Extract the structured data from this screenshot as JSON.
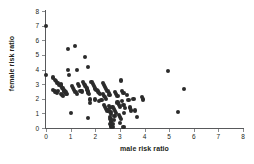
{
  "chart_data": {
    "type": "scatter",
    "title": "",
    "xlabel": "male risk ratio",
    "ylabel": "female risk ratio",
    "xlim": [
      0,
      8
    ],
    "ylim": [
      0,
      8
    ],
    "xticks": [
      0,
      1,
      2,
      3,
      4,
      5,
      6,
      7,
      8
    ],
    "yticks": [
      0,
      1,
      2,
      3,
      4,
      5,
      6,
      7,
      8
    ],
    "xtick_labels": [
      "0",
      "1",
      "2",
      "3",
      "4",
      "5",
      "6",
      "7",
      "8"
    ],
    "ytick_labels": [
      "0",
      "1",
      "2",
      "3",
      "4",
      "5",
      "6",
      "7",
      "8"
    ],
    "grid": false,
    "legend": false,
    "marker": "filled-circle",
    "marker_color": "#2b2b2b",
    "axis_color": "#58595b",
    "background_color": "#ffffff",
    "n_points": 120,
    "points": [
      [
        0.0,
        7.0
      ],
      [
        0.0,
        3.6
      ],
      [
        0.3,
        3.45
      ],
      [
        0.35,
        3.3
      ],
      [
        0.4,
        3.2
      ],
      [
        0.45,
        3.1
      ],
      [
        0.5,
        3.05
      ],
      [
        0.3,
        2.6
      ],
      [
        0.35,
        2.5
      ],
      [
        0.4,
        2.45
      ],
      [
        0.45,
        2.4
      ],
      [
        0.5,
        2.55
      ],
      [
        0.55,
        2.95
      ],
      [
        0.6,
        3.0
      ],
      [
        0.62,
        2.9
      ],
      [
        0.65,
        2.75
      ],
      [
        0.7,
        2.7
      ],
      [
        0.72,
        2.6
      ],
      [
        0.75,
        2.5
      ],
      [
        0.8,
        2.45
      ],
      [
        0.82,
        2.35
      ],
      [
        0.85,
        2.3
      ],
      [
        0.6,
        2.35
      ],
      [
        0.65,
        2.25
      ],
      [
        0.7,
        2.2
      ],
      [
        0.88,
        5.4
      ],
      [
        0.9,
        3.95
      ],
      [
        0.95,
        3.6
      ],
      [
        1.0,
        1.0
      ],
      [
        1.05,
        2.85
      ],
      [
        1.1,
        2.75
      ],
      [
        1.15,
        2.6
      ],
      [
        1.2,
        2.45
      ],
      [
        1.25,
        2.35
      ],
      [
        1.18,
        5.62
      ],
      [
        1.25,
        3.95
      ],
      [
        1.3,
        3.0
      ],
      [
        1.35,
        2.85
      ],
      [
        1.4,
        2.55
      ],
      [
        1.45,
        2.5
      ],
      [
        1.5,
        3.15
      ],
      [
        1.55,
        3.0
      ],
      [
        1.6,
        2.9
      ],
      [
        1.62,
        2.8
      ],
      [
        1.65,
        2.7
      ],
      [
        1.68,
        2.6
      ],
      [
        1.7,
        2.5
      ],
      [
        1.72,
        2.4
      ],
      [
        1.75,
        2.3
      ],
      [
        1.6,
        4.85
      ],
      [
        1.7,
        4.15
      ],
      [
        1.78,
        1.95
      ],
      [
        1.8,
        1.7
      ],
      [
        1.72,
        0.7
      ],
      [
        1.85,
        3.15
      ],
      [
        1.9,
        3.0
      ],
      [
        1.95,
        2.85
      ],
      [
        2.0,
        2.7
      ],
      [
        2.05,
        2.6
      ],
      [
        2.1,
        2.5
      ],
      [
        2.15,
        2.4
      ],
      [
        2.2,
        2.3
      ],
      [
        2.0,
        1.95
      ],
      [
        2.15,
        1.85
      ],
      [
        2.25,
        1.9
      ],
      [
        2.3,
        3.1
      ],
      [
        2.35,
        2.95
      ],
      [
        2.4,
        2.8
      ],
      [
        2.45,
        2.65
      ],
      [
        2.3,
        2.3
      ],
      [
        2.35,
        2.2
      ],
      [
        2.4,
        2.1
      ],
      [
        2.45,
        2.0
      ],
      [
        2.35,
        1.6
      ],
      [
        2.4,
        1.45
      ],
      [
        2.45,
        1.3
      ],
      [
        2.5,
        1.2
      ],
      [
        2.5,
        2.55
      ],
      [
        2.55,
        2.4
      ],
      [
        2.58,
        2.25
      ],
      [
        2.55,
        1.5
      ],
      [
        2.6,
        1.35
      ],
      [
        2.62,
        1.1
      ],
      [
        2.65,
        0.95
      ],
      [
        2.6,
        0.75
      ],
      [
        2.62,
        0.6
      ],
      [
        2.65,
        0.45
      ],
      [
        2.6,
        0.25
      ],
      [
        2.65,
        0.1
      ],
      [
        2.7,
        0.05
      ],
      [
        2.72,
        0.3
      ],
      [
        2.75,
        0.55
      ],
      [
        2.78,
        0.8
      ],
      [
        2.7,
        1.45
      ],
      [
        2.75,
        1.3
      ],
      [
        2.8,
        1.15
      ],
      [
        2.85,
        1.0
      ],
      [
        2.8,
        2.45
      ],
      [
        2.85,
        2.3
      ],
      [
        2.9,
        2.2
      ],
      [
        2.9,
        1.75
      ],
      [
        2.95,
        1.6
      ],
      [
        3.0,
        1.45
      ],
      [
        2.95,
        0.9
      ],
      [
        3.0,
        0.75
      ],
      [
        3.05,
        0.6
      ],
      [
        3.02,
        0.35
      ],
      [
        3.05,
        3.25
      ],
      [
        3.1,
        2.55
      ],
      [
        3.15,
        2.4
      ],
      [
        3.1,
        1.85
      ],
      [
        3.15,
        1.6
      ],
      [
        3.2,
        1.35
      ],
      [
        3.18,
        1.05
      ],
      [
        3.15,
        0.05
      ],
      [
        3.3,
        2.25
      ],
      [
        3.35,
        1.9
      ],
      [
        3.4,
        1.4
      ],
      [
        3.45,
        1.2
      ],
      [
        3.55,
        2.0
      ],
      [
        3.6,
        1.2
      ],
      [
        3.7,
        0.75
      ],
      [
        3.9,
        2.1
      ],
      [
        3.95,
        1.95
      ],
      [
        4.95,
        3.9
      ],
      [
        5.6,
        2.65
      ],
      [
        5.35,
        1.1
      ]
    ]
  }
}
